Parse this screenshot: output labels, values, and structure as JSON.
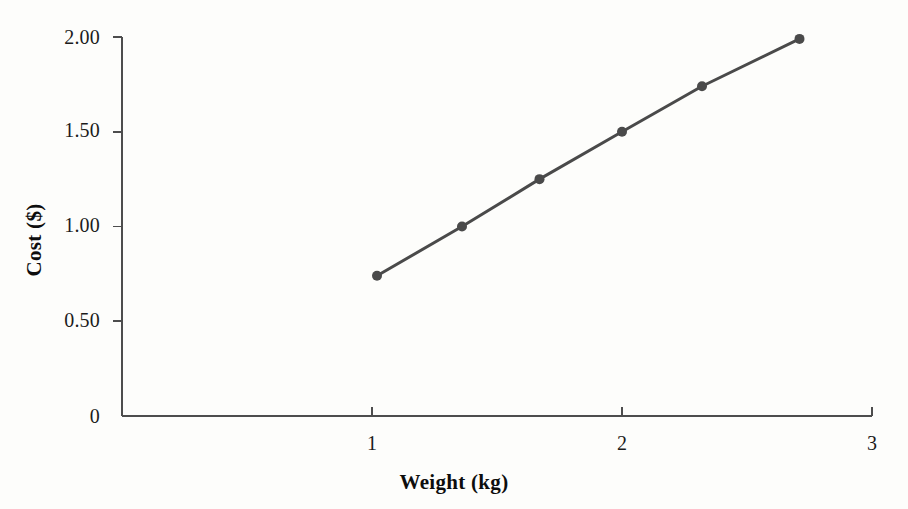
{
  "chart_data": {
    "type": "line",
    "title": "",
    "subtitle": "",
    "xlabel": "Weight (kg)",
    "ylabel": "Cost ($)",
    "xlim": [
      0.4,
      3.0
    ],
    "ylim": [
      0,
      2.0
    ],
    "grid": false,
    "legend": null,
    "legend_position": "none",
    "x_ticks": [
      {
        "value": 1,
        "label": "1"
      },
      {
        "value": 2,
        "label": "2"
      },
      {
        "value": 3,
        "label": "3"
      }
    ],
    "y_ticks": [
      {
        "value": 0,
        "label": "0"
      },
      {
        "value": 0.5,
        "label": "0.50"
      },
      {
        "value": 1.0,
        "label": "1.00"
      },
      {
        "value": 1.5,
        "label": "1.50"
      },
      {
        "value": 2.0,
        "label": "2.00"
      }
    ],
    "series": [
      {
        "name": "Cost vs Weight",
        "color": "#4a4a4a",
        "marker": "circle",
        "x": [
          1.02,
          1.36,
          1.67,
          2.0,
          2.32,
          2.71
        ],
        "y": [
          0.74,
          1.0,
          1.25,
          1.5,
          1.74,
          1.99
        ],
        "points": [
          {
            "x": 1.02,
            "y": 0.74
          },
          {
            "x": 1.36,
            "y": 1.0
          },
          {
            "x": 1.67,
            "y": 1.25
          },
          {
            "x": 2.0,
            "y": 1.5
          },
          {
            "x": 2.32,
            "y": 1.74
          },
          {
            "x": 2.71,
            "y": 1.99
          }
        ]
      }
    ],
    "annotations": [],
    "colors": {
      "line": "#4a4a4a",
      "marker": "#4a4a4a",
      "axis": "#4d4d4d",
      "text": "#121212",
      "background": "#fdfdfb"
    }
  },
  "axes": {
    "x_tick_labels": [
      "1",
      "2",
      "3"
    ],
    "y_tick_labels": [
      "0",
      "0.50",
      "1.00",
      "1.50",
      "2.00"
    ]
  }
}
